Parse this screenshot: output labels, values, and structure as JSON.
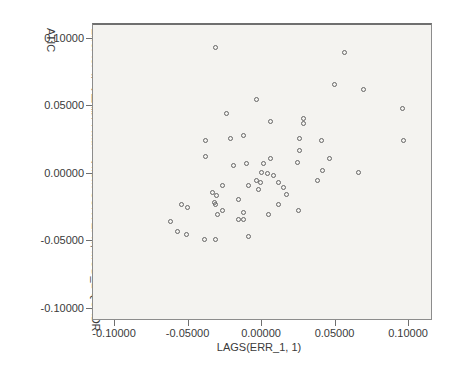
{
  "chart_data": {
    "type": "scatter",
    "title": "",
    "xlabel": "LAGS(ERR_1, 1)",
    "ylabel": "Error for 每小時薪資 with 月 from CURVEFIT, MOD_1 QUADRATIC",
    "ylabel_lines": [
      "Error for 每小時薪資 with 月 from CURVEFIT, MOD_1 QUADR",
      "ATIC"
    ],
    "x_tick_labels": [
      "-0.10000",
      "-0.05000",
      "0.00000",
      "0.05000",
      "0.10000"
    ],
    "x_tick_values": [
      -0.1,
      -0.05,
      0.0,
      0.05,
      0.1
    ],
    "y_tick_labels": [
      "0.10000",
      "0.05000",
      "0.00000",
      "-0.05000",
      "-0.10000"
    ],
    "y_tick_values": [
      0.1,
      0.05,
      0.0,
      -0.05,
      -0.1
    ],
    "xlim": [
      -0.115,
      0.1163
    ],
    "ylim": [
      -0.1089,
      0.1111
    ],
    "grid": false,
    "legend": "none",
    "marker": "open-circle",
    "marker_color": "#666666",
    "plot_bg_color": "#f4f3f0",
    "frame_color": "#8c8c8c",
    "points": [
      [
        -0.0313,
        0.0926
      ],
      [
        -0.0034,
        0.0541
      ],
      [
        -0.0238,
        0.0437
      ],
      [
        -0.0381,
        0.0244
      ],
      [
        -0.0211,
        0.0252
      ],
      [
        -0.0122,
        0.0274
      ],
      [
        -0.0381,
        0.0119
      ],
      [
        -0.019,
        0.0059
      ],
      [
        -0.0102,
        0.0067
      ],
      [
        0.0571,
        0.0896
      ],
      [
        0.0503,
        0.0652
      ],
      [
        0.0694,
        0.0622
      ],
      [
        0.0959,
        0.0474
      ],
      [
        0.0061,
        0.0385
      ],
      [
        0.0286,
        0.0407
      ],
      [
        0.0286,
        0.0363
      ],
      [
        0.0259,
        0.0259
      ],
      [
        0.0408,
        0.0237
      ],
      [
        0.0966,
        0.0244
      ],
      [
        0.0259,
        0.017
      ],
      [
        0.0061,
        0.0111
      ],
      [
        0.0469,
        0.0104
      ],
      [
        0.0245,
        0.0081
      ],
      [
        0.0415,
        0.0022
      ],
      [
        0.066,
        0.0007
      ],
      [
        0.0014,
        0.0067
      ],
      [
        0.0,
        0.0
      ],
      [
        0.0041,
        -0.0007
      ],
      [
        0.0082,
        -0.0015
      ],
      [
        -0.0034,
        -0.0059
      ],
      [
        -0.0007,
        -0.0074
      ],
      [
        -0.0088,
        -0.0096
      ],
      [
        -0.002,
        -0.0126
      ],
      [
        0.0116,
        -0.0074
      ],
      [
        0.015,
        -0.0104
      ],
      [
        0.017,
        -0.0163
      ],
      [
        0.0381,
        -0.0059
      ],
      [
        0.0116,
        -0.023
      ],
      [
        0.0048,
        -0.0304
      ],
      [
        0.0252,
        -0.0281
      ],
      [
        -0.0259,
        -0.0089
      ],
      [
        -0.0327,
        -0.0141
      ],
      [
        -0.0306,
        -0.017
      ],
      [
        -0.0544,
        -0.023
      ],
      [
        -0.0497,
        -0.0259
      ],
      [
        -0.032,
        -0.0222
      ],
      [
        -0.0313,
        -0.023
      ],
      [
        -0.0265,
        -0.0281
      ],
      [
        -0.0293,
        -0.0304
      ],
      [
        -0.015,
        -0.02
      ],
      [
        -0.0116,
        -0.0289
      ],
      [
        -0.0619,
        -0.0356
      ],
      [
        -0.015,
        -0.0348
      ],
      [
        -0.0116,
        -0.0348
      ],
      [
        -0.0565,
        -0.0437
      ],
      [
        -0.051,
        -0.0459
      ],
      [
        -0.0388,
        -0.0489
      ],
      [
        -0.0313,
        -0.0489
      ],
      [
        -0.0082,
        -0.0467
      ]
    ]
  },
  "layout_note": ""
}
